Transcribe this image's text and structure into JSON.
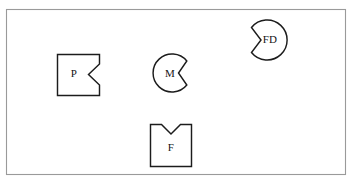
{
  "canvas": {
    "width": 352,
    "height": 184,
    "background_color": "#ffffff"
  },
  "frame": {
    "name": "outer-border",
    "x": 6.5,
    "y": 9.5,
    "width": 339,
    "height": 165,
    "stroke_color": "#9a9a9a",
    "fill_color": "#ffffff"
  },
  "style": {
    "shape_stroke_color": "#1c1c1c",
    "shape_fill_color": "#ffffff",
    "label_color": "#141414"
  },
  "shapes": [
    {
      "id": "shape-p",
      "label": "P",
      "base_form": "square",
      "notch_side": "right",
      "notch_form": "v-wedge",
      "label_x": 74,
      "label_y": 74,
      "path": "M 57.5 54.5 L 99.5 54.5 L 99.5 64.0 L 88.5 74.5 L 99.5 85.0 L 99.5 95.5 L 57.5 95.5 Z"
    },
    {
      "id": "shape-m",
      "label": "M",
      "base_form": "circle",
      "notch_side": "right",
      "notch_form": "v-wedge",
      "label_x": 170,
      "label_y": 74,
      "center_x": 172,
      "center_y": 73,
      "radius": 19,
      "path": "M 186.8 61.0 A 19 19 0 1 0 186.8 85.0 L 178.5 73.0 Z"
    },
    {
      "id": "shape-fd",
      "label": "FD",
      "base_form": "circle",
      "notch_side": "left",
      "notch_form": "v-wedge",
      "label_x": 270,
      "label_y": 40,
      "center_x": 267,
      "center_y": 40,
      "radius": 20,
      "path": "M 251.5 27.5 A 20 20 0 1 1 251.5 52.5 L 261.0 40.0 Z"
    },
    {
      "id": "shape-f",
      "label": "F",
      "base_form": "square",
      "notch_side": "top",
      "notch_form": "v-wedge",
      "label_x": 171,
      "label_y": 148,
      "path": "M 150.5 124.5 L 161.5 124.5 L 171.0 134.0 L 180.5 124.5 L 191.5 124.5 L 191.5 166.5 L 150.5 166.5 Z"
    }
  ]
}
